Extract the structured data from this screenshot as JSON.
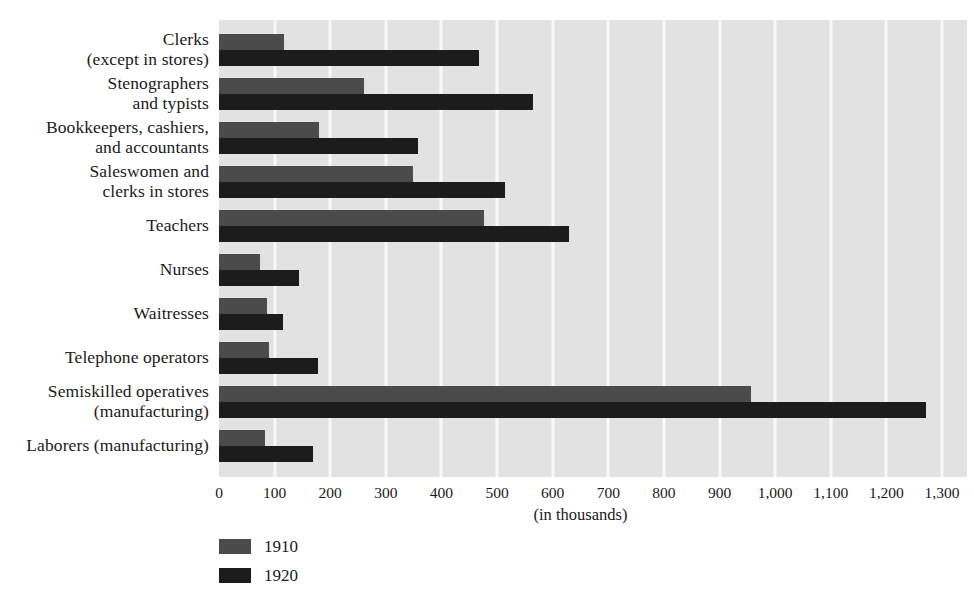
{
  "chart_data": {
    "type": "bar",
    "orientation": "horizontal",
    "title": "",
    "xlabel": "(in thousands)",
    "ylabel": "",
    "xlim": [
      0,
      1345
    ],
    "grid": true,
    "legend_position": "bottom-left",
    "plot_bg_color": "#e2e2e2",
    "gridline_color": "#f8f8f8",
    "categories": [
      [
        "Clerks",
        "(except in stores)"
      ],
      [
        "Stenographers",
        "and typists"
      ],
      [
        "Bookkeepers, cashiers,",
        "and accountants"
      ],
      [
        "Saleswomen and",
        "clerks in stores"
      ],
      [
        "Teachers"
      ],
      [
        "Nurses"
      ],
      [
        "Waitresses"
      ],
      [
        "Telephone operators"
      ],
      [
        "Semiskilled operatives",
        "(manufacturing)"
      ],
      [
        "Laborers (manufacturing)"
      ]
    ],
    "xticks": [
      0,
      100,
      200,
      300,
      400,
      500,
      600,
      700,
      800,
      900,
      1000,
      1100,
      1200,
      1300
    ],
    "xtick_labels": [
      "0",
      "100",
      "200",
      "300",
      "400",
      "500",
      "600",
      "700",
      "800",
      "900",
      "1,000",
      "1,100",
      "1,200",
      "1,300"
    ],
    "series": [
      {
        "name": "1910",
        "color": "#4b4b4b",
        "values": [
          117,
          261,
          179,
          349,
          476,
          74,
          86,
          90,
          957,
          82
        ]
      },
      {
        "name": "1920",
        "color": "#1c1c1c",
        "values": [
          468,
          564,
          357,
          514,
          629,
          143,
          115,
          178,
          1272,
          169
        ]
      }
    ]
  }
}
